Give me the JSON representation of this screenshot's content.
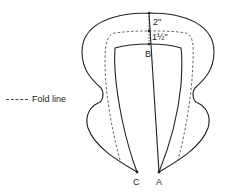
{
  "diagram": {
    "legend": {
      "fold_line_label": "Fold line"
    },
    "measurements": {
      "outer_to_fold": "2\"",
      "fold_to_inner": "1½\""
    },
    "points": {
      "top_inner": "B",
      "bottom_left": "C",
      "bottom_right": "A"
    },
    "colors": {
      "stroke": "#222222",
      "dashed": "#555555",
      "background": "#ffffff"
    }
  }
}
